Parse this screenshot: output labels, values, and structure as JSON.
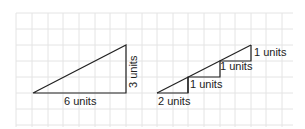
{
  "diagram": {
    "left_triangle": {
      "base_label": "6 units",
      "height_label": "3 units"
    },
    "right_staircase": {
      "step_labels": [
        "2 units",
        "1 units",
        "1 units",
        "1 units"
      ]
    },
    "colors": {
      "grid": "#e2e2e2",
      "line": "#222222",
      "background": "#ffffff"
    }
  }
}
